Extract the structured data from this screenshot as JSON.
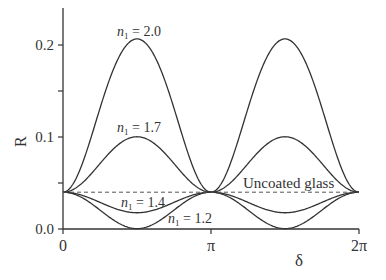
{
  "chart_data": {
    "type": "line",
    "title": "",
    "xlabel": "δ",
    "ylabel": "R",
    "xlim": [
      0,
      6.2832
    ],
    "ylim": [
      0.0,
      0.25
    ],
    "x_ticks": [
      {
        "value": 0,
        "label": "0"
      },
      {
        "value": 3.1416,
        "label": "π"
      },
      {
        "value": 6.2832,
        "label": "2π"
      }
    ],
    "y_ticks": [
      {
        "value": 0.0,
        "label": "0.0"
      },
      {
        "value": 0.05,
        "label": ""
      },
      {
        "value": 0.1,
        "label": "0.1"
      },
      {
        "value": 0.15,
        "label": ""
      },
      {
        "value": 0.2,
        "label": "0.2"
      }
    ],
    "grid": false,
    "legend": "none (inline annotations)",
    "substrate_index": 1.5,
    "series": [
      {
        "name": "n1 = 2.0",
        "n1": 2.0,
        "label_sub": "1",
        "label_value": "2.0",
        "x_deg_samples": [
          0,
          90,
          180,
          270,
          360
        ],
        "values": [
          0.04,
          0.2066,
          0.04,
          0.2066,
          0.04
        ]
      },
      {
        "name": "n1 = 1.7",
        "n1": 1.7,
        "label_sub": "1",
        "label_value": "1.7",
        "x_deg_samples": [
          0,
          90,
          180,
          270,
          360
        ],
        "values": [
          0.04,
          0.1003,
          0.04,
          0.1003,
          0.04
        ]
      },
      {
        "name": "n1 = 1.4",
        "n1": 1.4,
        "label_sub": "1",
        "label_value": "1.4",
        "x_deg_samples": [
          0,
          90,
          180,
          270,
          360
        ],
        "values": [
          0.04,
          0.0177,
          0.04,
          0.0177,
          0.04
        ]
      },
      {
        "name": "n1 = 1.2",
        "n1": 1.2,
        "label_sub": "1",
        "label_value": "1.2",
        "x_deg_samples": [
          0,
          90,
          180,
          270,
          360
        ],
        "values": [
          0.04,
          0.0004,
          0.04,
          0.0004,
          0.04
        ]
      },
      {
        "name": "Uncoated glass",
        "style": "dashed",
        "values_constant": 0.04
      }
    ],
    "annotations": [
      {
        "text": "Uncoated glass"
      }
    ]
  },
  "labels": {
    "ylabel": "R",
    "xlabel": "δ",
    "n_prefix": "n",
    "n_sub": "1",
    "eq": " = ",
    "uncoated": "Uncoated glass"
  }
}
